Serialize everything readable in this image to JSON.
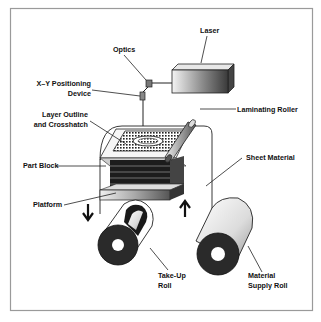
{
  "figure": {
    "frame_color": "#9a9a9a",
    "labels": {
      "optics": "Optics",
      "laser": "Laser",
      "xy_device_line1": "X–Y Positioning",
      "xy_device_line2": "Device",
      "layer_outline_line1": "Layer Outline",
      "layer_outline_line2": "and Crosshatch",
      "laminating_roller": "Laminating Roller",
      "part_block": "Part Block",
      "sheet_material": "Sheet Material",
      "platform": "Platform",
      "take_up_roll_line1": "Take-Up",
      "take_up_roll_line2": "Roll",
      "supply_roll_line1": "Material",
      "supply_roll_line2": "Supply Roll"
    },
    "arrows": {
      "platform_motion": "down-arrow",
      "sheet_motion": "up-arrow"
    }
  }
}
